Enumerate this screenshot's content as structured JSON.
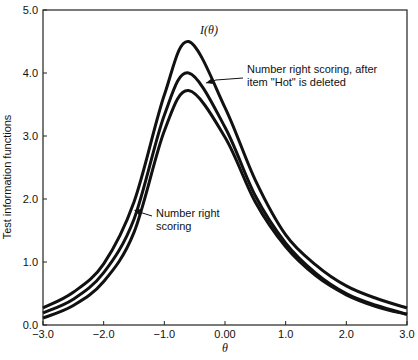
{
  "chart_data": {
    "type": "line",
    "title": "",
    "xlabel": "θ",
    "ylabel": "Test information functions",
    "xlim": [
      -3.0,
      3.0
    ],
    "ylim": [
      0.0,
      5.0
    ],
    "grid": false,
    "x_ticks": [
      -3.0,
      -2.0,
      -1.0,
      0.0,
      1.0,
      2.0,
      3.0
    ],
    "x_tick_labels": [
      "−3.0",
      "−2.0",
      "−1.0",
      "0.00",
      "1.0",
      "2.0",
      "3.0"
    ],
    "y_ticks": [
      0.0,
      1.0,
      2.0,
      3.0,
      4.0,
      5.0
    ],
    "y_tick_labels": [
      "0.0",
      "1.0",
      "2.0",
      "3.0",
      "4.0",
      "5.0"
    ],
    "x": [
      -3.0,
      -2.5,
      -2.0,
      -1.5,
      -1.0,
      -0.6,
      0.0,
      0.5,
      1.0,
      1.5,
      2.0,
      2.5,
      3.0
    ],
    "series": [
      {
        "name": "I(θ)",
        "values": [
          0.27,
          0.52,
          0.97,
          1.95,
          3.65,
          4.5,
          3.45,
          2.3,
          1.43,
          0.95,
          0.62,
          0.42,
          0.27
        ]
      },
      {
        "name": "Number right scoring, after item \"Hot\" is deleted",
        "values": [
          0.19,
          0.41,
          0.83,
          1.68,
          3.33,
          4.0,
          3.14,
          2.05,
          1.3,
          0.82,
          0.5,
          0.31,
          0.17
        ]
      },
      {
        "name": "Number right scoring",
        "values": [
          0.11,
          0.31,
          0.69,
          1.47,
          3.08,
          3.72,
          2.98,
          1.95,
          1.24,
          0.78,
          0.48,
          0.29,
          0.17
        ]
      }
    ],
    "annotations": [
      {
        "text": "I(θ)",
        "target_series": 0
      },
      {
        "lines": [
          "Number right scoring, after",
          "item \"Hot\" is deleted"
        ],
        "target_series": 1
      },
      {
        "lines": [
          "Number right",
          "scoring"
        ],
        "target_series": 2
      }
    ],
    "legend_position": "none (inline annotations)"
  }
}
